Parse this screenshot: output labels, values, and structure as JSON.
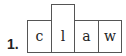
{
  "item_number": "1.",
  "word": "claw",
  "letters": [
    "c",
    "l",
    "a",
    "w"
  ],
  "tall_box_index": 1
}
